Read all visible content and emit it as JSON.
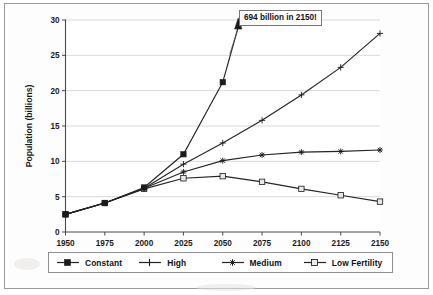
{
  "figure": {
    "background_color": "#ffffff",
    "frame_color": "#9a9a9a",
    "line_color": "#242424",
    "grid_color": "#c9c9c9"
  },
  "annotation": {
    "text": "694 billion in 2150!",
    "arrow_name": "up-arrow-icon"
  },
  "axes": {
    "y_title": "Population (billions)",
    "x_title": "",
    "y_ticks": [
      "0",
      "5",
      "10",
      "15",
      "20",
      "25",
      "30"
    ],
    "x_ticks": [
      "1950",
      "1975",
      "2000",
      "2025",
      "2050",
      "2075",
      "2100",
      "2125",
      "2150"
    ]
  },
  "legend": {
    "items": [
      {
        "label": "Constant",
        "marker": "filled-square"
      },
      {
        "label": "High",
        "marker": "plus"
      },
      {
        "label": "Medium",
        "marker": "asterisk"
      },
      {
        "label": "Low Fertility",
        "marker": "open-square"
      }
    ]
  },
  "chart_data": {
    "type": "line",
    "title": "",
    "xlabel": "",
    "ylabel": "Population (billions)",
    "xlim": [
      1950,
      2150
    ],
    "ylim": [
      0,
      30
    ],
    "grid": true,
    "legend_position": "bottom",
    "x": [
      1950,
      1975,
      2000,
      2025,
      2050,
      2075,
      2100,
      2125,
      2150
    ],
    "annotations": [
      {
        "text": "694 billion in 2150!",
        "refers_to": "Constant",
        "note": "Constant series leaves the plot area above 30 billion after 2050"
      }
    ],
    "series": [
      {
        "name": "Constant",
        "marker": "filled-square",
        "values": [
          2.5,
          4.1,
          6.3,
          11.0,
          21.2,
          null,
          null,
          null,
          null
        ],
        "offscale_note": "694 billion in 2150!"
      },
      {
        "name": "High",
        "marker": "plus",
        "values": [
          2.5,
          4.1,
          6.2,
          9.6,
          12.6,
          15.8,
          19.4,
          23.3,
          28.1
        ]
      },
      {
        "name": "Medium",
        "marker": "asterisk",
        "values": [
          2.5,
          4.1,
          6.2,
          8.5,
          10.1,
          10.9,
          11.3,
          11.4,
          11.6
        ]
      },
      {
        "name": "Low Fertility",
        "marker": "open-square",
        "values": [
          2.5,
          4.1,
          6.1,
          7.6,
          7.9,
          7.1,
          6.1,
          5.2,
          4.3
        ]
      }
    ]
  }
}
